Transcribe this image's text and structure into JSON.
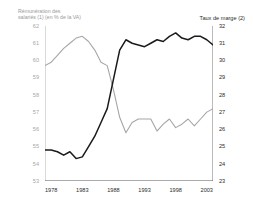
{
  "chart_data": {
    "type": "line",
    "title": "",
    "xlabel": "",
    "grid": false,
    "legend_position": "axis-captions",
    "x": [
      1977,
      1978,
      1979,
      1980,
      1981,
      1982,
      1983,
      1984,
      1985,
      1986,
      1987,
      1988,
      1989,
      1990,
      1991,
      1992,
      1993,
      1994,
      1995,
      1996,
      1997,
      1998,
      1999,
      2000,
      2001,
      2002,
      2003,
      2004
    ],
    "xlim": [
      1977,
      2004
    ],
    "xticks": [
      1978,
      1983,
      1988,
      1993,
      1998,
      2003
    ],
    "xticklabels": [
      "1978",
      "1983",
      "1988",
      "1993",
      "1998",
      "2003"
    ],
    "left_axis": {
      "label": "Rémunération des\nsalariés (1) (en % de la VA)",
      "color": "#a8a8a8",
      "ylim": [
        53,
        62
      ],
      "yticks": [
        53,
        54,
        55,
        56,
        57,
        58,
        59,
        60,
        61,
        62
      ],
      "yticklabels": [
        "53",
        "54",
        "55",
        "56",
        "57",
        "58",
        "59",
        "60",
        "61",
        "62"
      ]
    },
    "right_axis": {
      "label": "Taux de marge (2)",
      "color": "#2b2b2b",
      "ylim": [
        23,
        32
      ],
      "yticks": [
        23,
        24,
        25,
        26,
        27,
        28,
        29,
        30,
        31,
        32
      ],
      "yticklabels": [
        "23",
        "24",
        "25",
        "26",
        "27",
        "28",
        "29",
        "30",
        "31",
        "32"
      ]
    },
    "series": [
      {
        "name": "Rémunération des salariés (1) (en % de la VA)",
        "axis": "left",
        "color": "#a6a6a6",
        "values": [
          59.7,
          59.9,
          60.3,
          60.7,
          61.0,
          61.3,
          61.4,
          61.1,
          60.6,
          59.9,
          59.7,
          58.3,
          56.7,
          55.8,
          56.4,
          56.6,
          56.6,
          56.6,
          55.9,
          56.3,
          56.6,
          56.1,
          56.3,
          56.6,
          56.2,
          56.6,
          57.0,
          57.2
        ]
      },
      {
        "name": "Taux de marge (2)",
        "axis": "right",
        "color": "#1a1a1a",
        "values": [
          24.8,
          24.8,
          24.7,
          24.5,
          24.7,
          24.3,
          24.4,
          25.0,
          25.6,
          26.4,
          27.2,
          28.9,
          30.6,
          31.2,
          31.0,
          30.9,
          30.8,
          31.0,
          31.2,
          31.1,
          31.4,
          31.6,
          31.3,
          31.2,
          31.4,
          31.4,
          31.2,
          30.9
        ]
      }
    ]
  }
}
